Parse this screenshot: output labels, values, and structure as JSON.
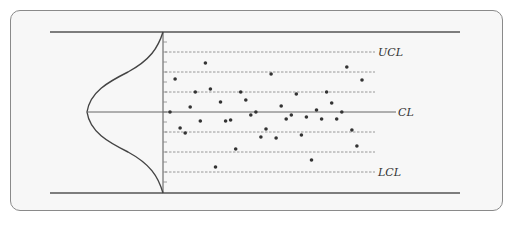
{
  "diagram": {
    "labels": {
      "ucl": "UCL",
      "cl": "CL",
      "lcl": "LCL"
    },
    "colors": {
      "panel_border": "#8a8a8a",
      "panel_bg": "#f7f7f7",
      "line": "#555555",
      "dashed": "#8c8c8c",
      "point": "#333333"
    }
  },
  "chart_data": {
    "type": "scatter",
    "title": "",
    "xlabel": "",
    "ylabel": "",
    "reference_lines": [
      {
        "name": "UCL",
        "y_sigma": 3,
        "style": "dashed"
      },
      {
        "name": "+2σ",
        "y_sigma": 2,
        "style": "dashed"
      },
      {
        "name": "+1σ",
        "y_sigma": 1,
        "style": "dashed"
      },
      {
        "name": "CL",
        "y_sigma": 0,
        "style": "solid"
      },
      {
        "name": "-1σ",
        "y_sigma": -1,
        "style": "dashed"
      },
      {
        "name": "-2σ",
        "y_sigma": -2,
        "style": "dashed"
      },
      {
        "name": "LCL",
        "y_sigma": -3,
        "style": "dashed"
      }
    ],
    "ylim_sigma": [
      -4,
      4
    ],
    "distribution": "normal (bell curve drawn sideways on left of axis)",
    "points_sigma": [
      {
        "x": 1,
        "y": 0.0
      },
      {
        "x": 2,
        "y": 1.65
      },
      {
        "x": 3,
        "y": -0.8
      },
      {
        "x": 4,
        "y": -1.05
      },
      {
        "x": 5,
        "y": 0.25
      },
      {
        "x": 6,
        "y": 1.0
      },
      {
        "x": 7,
        "y": -0.45
      },
      {
        "x": 8,
        "y": 2.45
      },
      {
        "x": 9,
        "y": 1.15
      },
      {
        "x": 10,
        "y": -2.75
      },
      {
        "x": 11,
        "y": 0.5
      },
      {
        "x": 12,
        "y": -0.45
      },
      {
        "x": 13,
        "y": -0.4
      },
      {
        "x": 14,
        "y": -1.85
      },
      {
        "x": 15,
        "y": 1.0
      },
      {
        "x": 16,
        "y": 0.6
      },
      {
        "x": 17,
        "y": -0.15
      },
      {
        "x": 18,
        "y": 0.0
      },
      {
        "x": 19,
        "y": -1.25
      },
      {
        "x": 20,
        "y": -0.85
      },
      {
        "x": 21,
        "y": 1.9
      },
      {
        "x": 22,
        "y": -1.3
      },
      {
        "x": 23,
        "y": 0.3
      },
      {
        "x": 24,
        "y": -0.35
      },
      {
        "x": 25,
        "y": -0.15
      },
      {
        "x": 26,
        "y": 0.9
      },
      {
        "x": 27,
        "y": -1.15
      },
      {
        "x": 28,
        "y": -0.25
      },
      {
        "x": 29,
        "y": -2.4
      },
      {
        "x": 30,
        "y": 0.1
      },
      {
        "x": 31,
        "y": -0.35
      },
      {
        "x": 32,
        "y": 1.0
      },
      {
        "x": 33,
        "y": 0.45
      },
      {
        "x": 34,
        "y": -0.35
      },
      {
        "x": 35,
        "y": 0.0
      },
      {
        "x": 36,
        "y": 2.25
      },
      {
        "x": 37,
        "y": -0.9
      },
      {
        "x": 38,
        "y": -1.7
      },
      {
        "x": 39,
        "y": 1.6
      }
    ]
  }
}
